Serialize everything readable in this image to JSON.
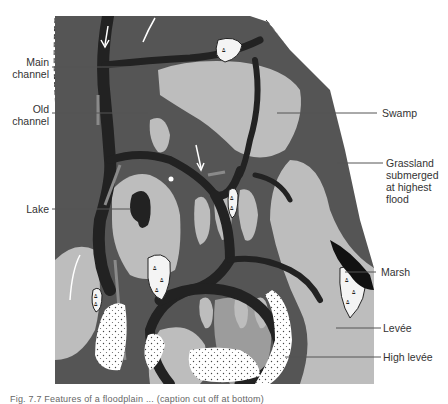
{
  "figure": {
    "type": "floodplain-diagram",
    "colors": {
      "background": "#ffffff",
      "high_levee_dotted": "#ffffff",
      "levee_light": "#bdbdbd",
      "swamp_medium": "#555555",
      "channel_dark": "#222222",
      "old_channel": "#8a8a8a",
      "marsh_fill": "#f4f4f4",
      "label_text": "#333333",
      "leader_line": "#555555"
    },
    "labels": {
      "main_channel": {
        "line1": "Main",
        "line2": "channel"
      },
      "old_channel": {
        "line1": "Old",
        "line2": "channel"
      },
      "lake": "Lake",
      "swamp": "Swamp",
      "grassland": {
        "line1": "Grassland",
        "line2": "submerged",
        "line3": "at highest",
        "line4": "flood"
      },
      "marsh": "Marsh",
      "levee": "Levée",
      "high_levee": "High levée"
    },
    "caption": "Fig. 7.7 Features of a floodplain ... (caption cut off at bottom)"
  }
}
